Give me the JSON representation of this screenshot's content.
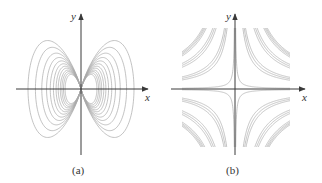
{
  "chart_data": [
    {
      "type": "diagram",
      "panel": "a",
      "caption": "(a)",
      "description": "Dipole-like family of closed curves passing through the origin, symmetric lobes left and right of the y-axis",
      "xlabel": "x",
      "ylabel": "y",
      "origin_px": [
        81,
        89
      ],
      "lobe_width_px": 53,
      "lobe_half_height_px": 59,
      "loop_scales": [
        1.0,
        0.86,
        0.74,
        0.65,
        0.58,
        0.52,
        0.47,
        0.43,
        0.39,
        0.36,
        0.33,
        0.3
      ],
      "colors": {
        "axis": "#3a3a3a",
        "curve": "#a9a9a9"
      }
    },
    {
      "type": "diagram",
      "panel": "b",
      "caption": "(b)",
      "description": "Family of rectangular hyperbolas xy = c in all four quadrants, clipped to a square",
      "xlabel": "x",
      "ylabel": "y",
      "origin_px": [
        235,
        89
      ],
      "clip_box_px": [
        182,
        28,
        290,
        147
      ],
      "c_values": [
        40,
        480,
        560,
        640,
        1150,
        1250,
        1350,
        1750,
        1830,
        1900,
        1970
      ],
      "colors": {
        "axis": "#3a3a3a",
        "curve": "#a9a9a9"
      }
    }
  ],
  "panels": {
    "a": {
      "x_label": "x",
      "y_label": "y",
      "caption": "(a)"
    },
    "b": {
      "x_label": "x",
      "y_label": "y",
      "caption": "(b)"
    }
  }
}
